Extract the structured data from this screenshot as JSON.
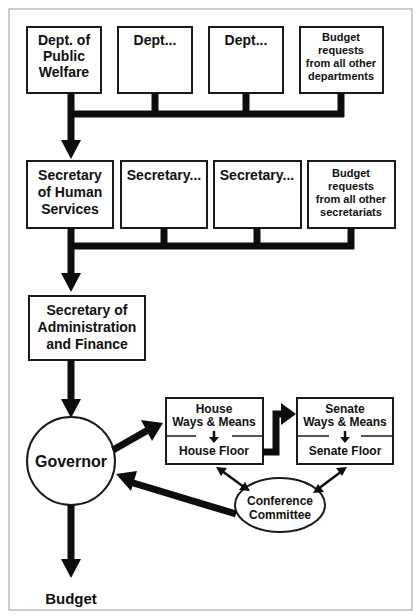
{
  "diagram": {
    "departments": [
      {
        "lines": [
          "Dept. of",
          "Public",
          "Welfare"
        ]
      },
      {
        "lines": [
          "Dept..."
        ]
      },
      {
        "lines": [
          "Dept..."
        ]
      },
      {
        "lines": [
          "Budget",
          "requests",
          "from all other",
          "departments"
        ]
      }
    ],
    "secretaries": [
      {
        "lines": [
          "Secretary",
          "of Human",
          "Services"
        ]
      },
      {
        "lines": [
          "Secretary..."
        ]
      },
      {
        "lines": [
          "Secretary..."
        ]
      },
      {
        "lines": [
          "Budget",
          "requests",
          "from all other",
          "secretariats"
        ]
      }
    ],
    "admin": {
      "lines": [
        "Secretary of",
        "Administration",
        "and Finance"
      ]
    },
    "governor": "Governor",
    "budget": "Budget",
    "house": {
      "top": [
        "House",
        "Ways & Means"
      ],
      "bottom": "House Floor"
    },
    "senate": {
      "top": [
        "Senate",
        "Ways & Means"
      ],
      "bottom": "Senate Floor"
    },
    "conference": [
      "Conference",
      "Committee"
    ]
  }
}
